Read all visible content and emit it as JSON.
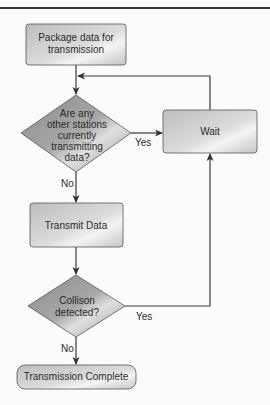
{
  "diagram": {
    "type": "flowchart",
    "nodes": [
      {
        "id": "package",
        "shape": "rectangle",
        "lines": [
          "Package data for",
          "transmission"
        ]
      },
      {
        "id": "check",
        "shape": "diamond",
        "lines": [
          "Are any",
          "other stations",
          "currently",
          "transmitting",
          "data?"
        ]
      },
      {
        "id": "wait",
        "shape": "rectangle",
        "lines": [
          "Wait"
        ]
      },
      {
        "id": "transmit",
        "shape": "rectangle",
        "lines": [
          "Transmit Data"
        ]
      },
      {
        "id": "collision",
        "shape": "diamond",
        "lines": [
          "Collison",
          "detected?"
        ]
      },
      {
        "id": "complete",
        "shape": "terminator",
        "lines": [
          "Transmission Complete"
        ]
      }
    ],
    "edges": [
      {
        "from": "package",
        "to": "check",
        "label": ""
      },
      {
        "from": "check",
        "to": "wait",
        "label": "Yes"
      },
      {
        "from": "check",
        "to": "transmit",
        "label": "No"
      },
      {
        "from": "wait",
        "to": "check",
        "label": ""
      },
      {
        "from": "transmit",
        "to": "collision",
        "label": ""
      },
      {
        "from": "collision",
        "to": "wait",
        "label": "Yes"
      },
      {
        "from": "collision",
        "to": "complete",
        "label": "No"
      }
    ],
    "edge_labels": {
      "check_yes": "Yes",
      "check_no": "No",
      "collision_yes": "Yes",
      "collision_no": "No"
    }
  }
}
